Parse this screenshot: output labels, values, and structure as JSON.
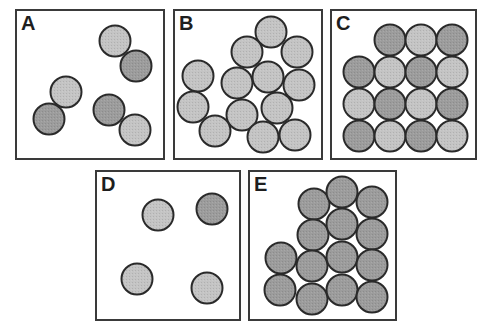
{
  "figure": {
    "colors": {
      "dark": "#9c9c9c",
      "light": "#c4c4c4",
      "outline": "#2a2a2a",
      "frame": "#3a3a3a"
    },
    "circle_radius": 15.5,
    "panels": [
      {
        "label": "A",
        "box": {
          "x": 15,
          "y": 9,
          "w": 150,
          "h": 151
        },
        "circles": [
          {
            "x": 115,
            "y": 41,
            "shade": "light"
          },
          {
            "x": 136,
            "y": 66,
            "shade": "dark"
          },
          {
            "x": 66,
            "y": 92,
            "shade": "light"
          },
          {
            "x": 49,
            "y": 119,
            "shade": "dark"
          },
          {
            "x": 109,
            "y": 110,
            "shade": "dark"
          },
          {
            "x": 135,
            "y": 130,
            "shade": "light"
          }
        ]
      },
      {
        "label": "B",
        "box": {
          "x": 173,
          "y": 9,
          "w": 150,
          "h": 151
        },
        "circles": [
          {
            "x": 271,
            "y": 32,
            "shade": "light"
          },
          {
            "x": 247,
            "y": 52,
            "shade": "light"
          },
          {
            "x": 297,
            "y": 52,
            "shade": "light"
          },
          {
            "x": 198,
            "y": 76,
            "shade": "light"
          },
          {
            "x": 237,
            "y": 83,
            "shade": "light"
          },
          {
            "x": 268,
            "y": 77,
            "shade": "light"
          },
          {
            "x": 299,
            "y": 85,
            "shade": "light"
          },
          {
            "x": 193,
            "y": 107,
            "shade": "light"
          },
          {
            "x": 242,
            "y": 115,
            "shade": "light"
          },
          {
            "x": 277,
            "y": 108,
            "shade": "light"
          },
          {
            "x": 215,
            "y": 131,
            "shade": "light"
          },
          {
            "x": 263,
            "y": 137,
            "shade": "light"
          },
          {
            "x": 295,
            "y": 135,
            "shade": "light"
          }
        ]
      },
      {
        "label": "C",
        "box": {
          "x": 330,
          "y": 9,
          "w": 147,
          "h": 151
        },
        "circles": [
          {
            "x": 390,
            "y": 40,
            "shade": "dark"
          },
          {
            "x": 421,
            "y": 40,
            "shade": "light"
          },
          {
            "x": 452,
            "y": 40,
            "shade": "dark"
          },
          {
            "x": 359,
            "y": 72,
            "shade": "dark"
          },
          {
            "x": 390,
            "y": 72,
            "shade": "light"
          },
          {
            "x": 421,
            "y": 72,
            "shade": "dark"
          },
          {
            "x": 452,
            "y": 72,
            "shade": "light"
          },
          {
            "x": 359,
            "y": 104,
            "shade": "light"
          },
          {
            "x": 390,
            "y": 104,
            "shade": "dark"
          },
          {
            "x": 421,
            "y": 104,
            "shade": "light"
          },
          {
            "x": 452,
            "y": 104,
            "shade": "dark"
          },
          {
            "x": 359,
            "y": 136,
            "shade": "dark"
          },
          {
            "x": 390,
            "y": 136,
            "shade": "light"
          },
          {
            "x": 421,
            "y": 136,
            "shade": "dark"
          },
          {
            "x": 452,
            "y": 136,
            "shade": "light"
          }
        ]
      },
      {
        "label": "D",
        "box": {
          "x": 95,
          "y": 170,
          "w": 146,
          "h": 151
        },
        "circles": [
          {
            "x": 158,
            "y": 215,
            "shade": "light"
          },
          {
            "x": 212,
            "y": 209,
            "shade": "dark"
          },
          {
            "x": 137,
            "y": 279,
            "shade": "light"
          },
          {
            "x": 207,
            "y": 288,
            "shade": "light"
          }
        ]
      },
      {
        "label": "E",
        "box": {
          "x": 248,
          "y": 170,
          "w": 149,
          "h": 151
        },
        "circles": [
          {
            "x": 281,
            "y": 258,
            "shade": "dark"
          },
          {
            "x": 280,
            "y": 290,
            "shade": "dark"
          },
          {
            "x": 314,
            "y": 204,
            "shade": "dark"
          },
          {
            "x": 313,
            "y": 235,
            "shade": "dark"
          },
          {
            "x": 312,
            "y": 266,
            "shade": "dark"
          },
          {
            "x": 312,
            "y": 299,
            "shade": "dark"
          },
          {
            "x": 342,
            "y": 192,
            "shade": "dark"
          },
          {
            "x": 342,
            "y": 224,
            "shade": "dark"
          },
          {
            "x": 342,
            "y": 257,
            "shade": "dark"
          },
          {
            "x": 342,
            "y": 290,
            "shade": "dark"
          },
          {
            "x": 372,
            "y": 202,
            "shade": "dark"
          },
          {
            "x": 372,
            "y": 234,
            "shade": "dark"
          },
          {
            "x": 372,
            "y": 265,
            "shade": "dark"
          },
          {
            "x": 372,
            "y": 297,
            "shade": "dark"
          }
        ]
      }
    ]
  }
}
